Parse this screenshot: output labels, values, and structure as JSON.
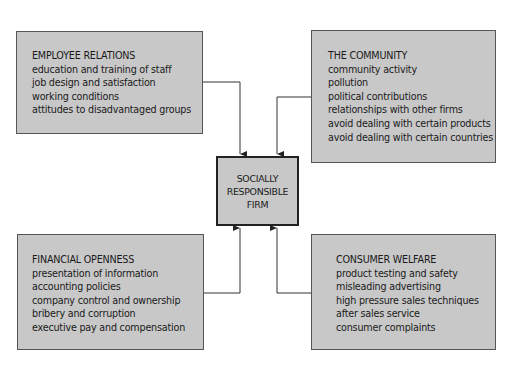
{
  "center": {
    "lines": [
      "SOCIALLY",
      "RESPONSIBLE",
      "FIRM"
    ]
  },
  "boxes": [
    {
      "title": "EMPLOYEE RELATIONS",
      "items": [
        "education and training of staff",
        "job design and satisfaction",
        "working conditions",
        "attitudes to disadvantaged groups"
      ]
    },
    {
      "title": "THE COMMUNITY",
      "items": [
        "community activity",
        "pollution",
        "political contributions",
        "relationships with other firms",
        "avoid dealing with certain products",
        "avoid dealing with certain countries"
      ]
    },
    {
      "title": "FINANCIAL OPENNESS",
      "items": [
        "presentation of information",
        "accounting policies",
        "company control and ownership",
        "bribery and corruption",
        "executive pay and compensation"
      ]
    },
    {
      "title": "CONSUMER WELFARE",
      "items": [
        "product testing and safety",
        "misleading advertising",
        "high pressure sales techniques",
        "after sales service",
        "consumer complaints"
      ]
    }
  ],
  "colors": {
    "box_fill": "#c8c8c8",
    "line": "#333333"
  }
}
